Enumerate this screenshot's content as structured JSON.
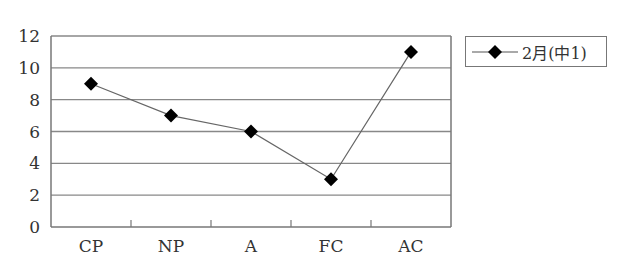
{
  "chart_data": {
    "type": "line",
    "title": "",
    "xlabel": "",
    "ylabel": "",
    "categories": [
      "CP",
      "NP",
      "A",
      "FC",
      "AC"
    ],
    "series": [
      {
        "name": "2月(中1)",
        "values": [
          9,
          7,
          6,
          3,
          11
        ],
        "marker": "diamond",
        "color": "#000000"
      }
    ],
    "ylim": [
      0,
      12
    ],
    "yticks": [
      0,
      2,
      4,
      6,
      8,
      10,
      12
    ],
    "grid": true,
    "legend_position": "right"
  },
  "legend": {
    "label": "2月(中1)"
  },
  "colors": {
    "line": "#666666",
    "marker": "#000000",
    "grid": "#888888",
    "axis": "#777777"
  }
}
